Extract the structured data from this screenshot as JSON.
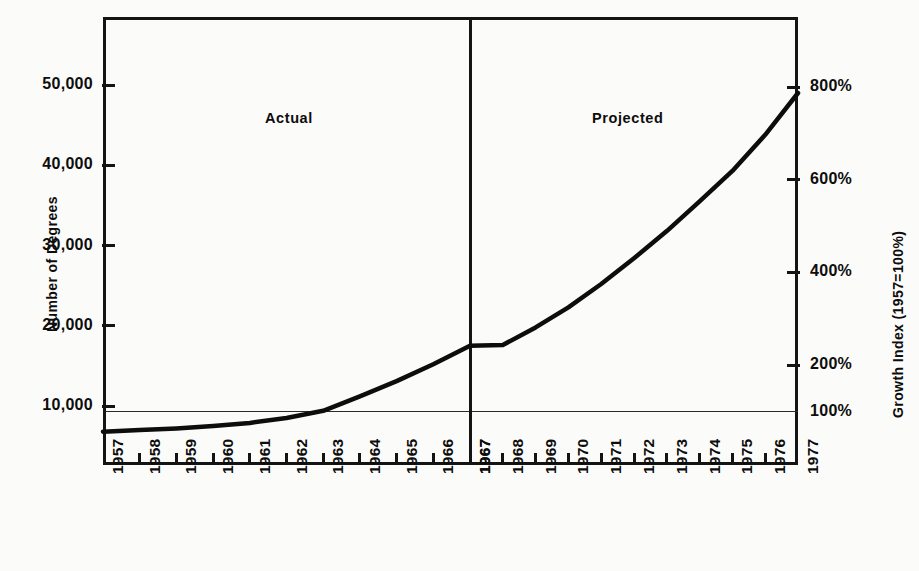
{
  "chart_data": {
    "type": "line",
    "title": "",
    "subtitle": "",
    "xlabel": "",
    "ylabel": "Number of Degrees",
    "y2label": "Growth Index (1957=100%)",
    "grid": false,
    "legend_position": "none",
    "x": [
      1957,
      1958,
      1959,
      1960,
      1961,
      1962,
      1963,
      1964,
      1965,
      1966,
      1967,
      1968,
      1969,
      1970,
      1971,
      1972,
      1973,
      1974,
      1975,
      1976,
      1977
    ],
    "xtick_labels": [
      "1957",
      "1958",
      "1959",
      "1960",
      "1961",
      "1962",
      "1963",
      "1964",
      "1965",
      "1966",
      "1967",
      "1967",
      "1968",
      "1969",
      "1970",
      "1971",
      "1972",
      "1973",
      "1974",
      "1975",
      "1976",
      "1977"
    ],
    "xlim": [
      1957,
      1977
    ],
    "ylim": [
      0,
      58000
    ],
    "ytick_values": [
      10000,
      20000,
      30000,
      40000,
      50000
    ],
    "ytick_labels": [
      "10,000",
      "20,000",
      "30,000",
      "40,000",
      "50,000"
    ],
    "y2lim": [
      0,
      940
    ],
    "y2tick_values": [
      100,
      200,
      400,
      600,
      800
    ],
    "y2tick_labels": [
      "100%",
      "200%",
      "400%",
      "600%",
      "800%"
    ],
    "series": [
      {
        "name": "Number of Degrees",
        "values": [
          6800,
          7000,
          7200,
          7500,
          7900,
          8500,
          9400,
          11200,
          13100,
          15200,
          17500,
          17600,
          19800,
          22300,
          25200,
          28400,
          31800,
          35500,
          39300,
          43800,
          49000
        ]
      }
    ],
    "annotations": [
      {
        "name": "actual-label",
        "text": "Actual",
        "x": 1961.5,
        "position": "upper-left-region"
      },
      {
        "name": "projected-label",
        "text": "Projected",
        "x": 1971.5,
        "position": "upper-right-region"
      },
      {
        "name": "baseline-100",
        "text": "",
        "y2": 100,
        "style": "thin horizontal rule"
      },
      {
        "name": "actual-projected-divider",
        "text": "",
        "x": 1967,
        "style": "thick vertical rule"
      }
    ]
  },
  "sections": {
    "actual_label": "Actual",
    "projected_label": "Projected"
  },
  "axes": {
    "left_title": "Number of Degrees",
    "right_title": "Growth Index (1957=100%)"
  },
  "colors": {
    "ink": "#141414",
    "paper": "#fbfbf9",
    "curve": "#0d0d0d"
  }
}
